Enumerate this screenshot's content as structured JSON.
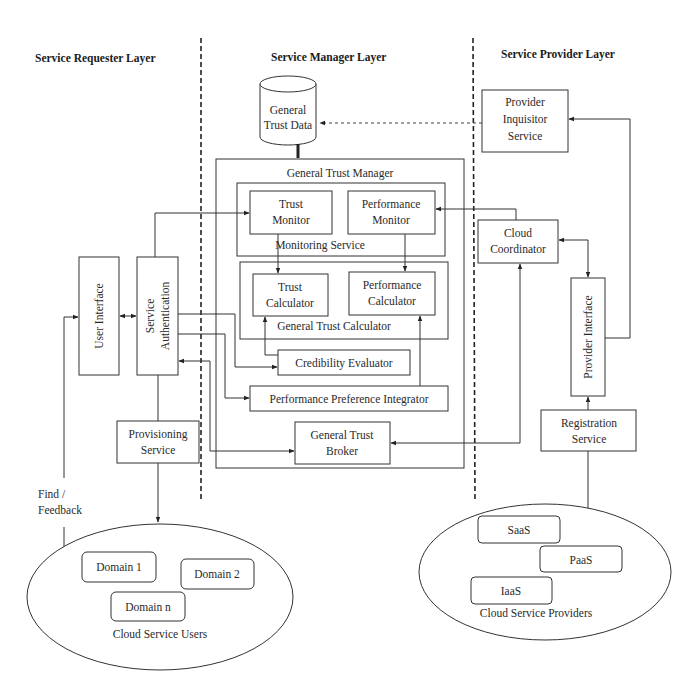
{
  "layers": {
    "requester": "Service Requester Layer",
    "manager": "Service Manager Layer",
    "provider": "Service Provider Layer"
  },
  "database": {
    "line1": "General",
    "line2": "Trust Data"
  },
  "manager": {
    "title": "General Trust Manager",
    "monitoring": {
      "title": "Monitoring Service",
      "trust_monitor": {
        "line1": "Trust",
        "line2": "Monitor"
      },
      "performance_monitor": {
        "line1": "Performance",
        "line2": "Monitor"
      }
    },
    "calculator": {
      "title": "General Trust Calculator",
      "trust_calculator": {
        "line1": "Trust",
        "line2": "Calculator"
      },
      "performance_calculator": {
        "line1": "Performance",
        "line2": "Calculator"
      }
    },
    "credibility_evaluator": "Credibility Evaluator",
    "performance_preference_integrator": "Performance Preference Integrator",
    "trust_broker": {
      "line1": "General Trust",
      "line2": "Broker"
    }
  },
  "requester": {
    "user_interface": "User Interface",
    "service_authentication": {
      "line1": "Service",
      "line2": "Authentication"
    },
    "provisioning_service": {
      "line1": "Provisioning",
      "line2": "Service"
    },
    "find_feedback": {
      "line1": "Find /",
      "line2": "Feedback"
    },
    "users": {
      "label": "Cloud Service Users",
      "domains": [
        "Domain 1",
        "Domain 2",
        "Domain n"
      ]
    }
  },
  "provider": {
    "inquisitor": {
      "line1": "Provider",
      "line2": "Inquisitor",
      "line3": "Service"
    },
    "cloud_coordinator": {
      "line1": "Cloud",
      "line2": "Coordinator"
    },
    "provider_interface": "Provider Interface",
    "registration_service": {
      "line1": "Registration",
      "line2": "Service"
    },
    "providers": {
      "label": "Cloud Service Providers",
      "services": [
        "SaaS",
        "PaaS",
        "IaaS"
      ]
    }
  }
}
